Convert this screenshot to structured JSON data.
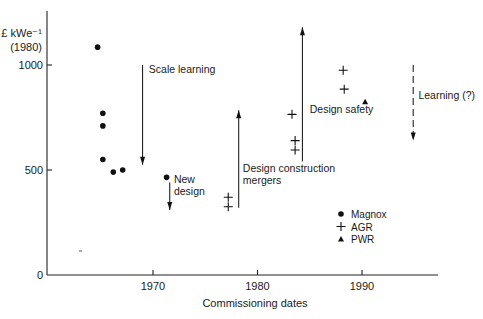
{
  "chart_data": {
    "type": "scatter",
    "title": "",
    "xlabel": "Commissioning dates",
    "ylabel": "£ kWe⁻¹",
    "ylabel_sub": "(1980)",
    "xlim": [
      1961.5,
      1997
    ],
    "ylim": [
      0,
      1150
    ],
    "x_ticks": [
      1970,
      1980,
      1990
    ],
    "x_tick_labels": [
      "1970",
      "1980",
      "1990"
    ],
    "y_ticks": [
      0,
      500,
      1000
    ],
    "y_tick_labels": [
      "0",
      "500",
      "1000"
    ],
    "grid": false,
    "legend_position": "lower right",
    "series": [
      {
        "name": "Magnox",
        "marker": "circle",
        "points": [
          {
            "x": 1964.7,
            "y": 1085
          },
          {
            "x": 1965.2,
            "y": 770
          },
          {
            "x": 1965.2,
            "y": 710
          },
          {
            "x": 1965.2,
            "y": 550
          },
          {
            "x": 1966.2,
            "y": 490
          },
          {
            "x": 1967.1,
            "y": 500
          },
          {
            "x": 1971.3,
            "y": 465
          }
        ]
      },
      {
        "name": "AGR",
        "marker": "plus",
        "points": [
          {
            "x": 1977.2,
            "y": 370
          },
          {
            "x": 1977.2,
            "y": 325
          },
          {
            "x": 1983.3,
            "y": 765
          },
          {
            "x": 1983.6,
            "y": 640
          },
          {
            "x": 1983.6,
            "y": 595
          },
          {
            "x": 1988.2,
            "y": 975
          },
          {
            "x": 1988.3,
            "y": 885
          }
        ]
      },
      {
        "name": "PWR",
        "marker": "triangle",
        "points": [
          {
            "x": 1990.3,
            "y": 825
          }
        ]
      }
    ],
    "annotations": [
      {
        "text": [
          "Scale learning"
        ],
        "arrow": {
          "x": 1969.0,
          "y_from": 1000,
          "y_to": 525,
          "direction": "down",
          "style": "solid"
        },
        "label_x": 1969.6,
        "label_y": 960
      },
      {
        "text": [
          "New",
          "design"
        ],
        "arrow": {
          "x": 1971.6,
          "y_from": 440,
          "y_to": 310,
          "direction": "down",
          "style": "solid"
        },
        "label_x": 1972.0,
        "label_y": 440
      },
      {
        "text": [
          "Design construction",
          "mergers"
        ],
        "arrow": {
          "x": 1978.2,
          "y_from": 320,
          "y_to": 785,
          "direction": "up",
          "style": "solid"
        },
        "label_x": 1978.6,
        "label_y": 490
      },
      {
        "text": [
          "Design safety"
        ],
        "arrow": {
          "x": 1984.3,
          "y_from": 540,
          "y_to": 1180,
          "direction": "up",
          "style": "solid"
        },
        "label_x": 1985.0,
        "label_y": 770
      },
      {
        "text": [
          "Learning (?)"
        ],
        "arrow": {
          "x": 1994.9,
          "y_from": 1000,
          "y_to": 640,
          "direction": "down",
          "style": "dashed"
        },
        "label_x": 1995.4,
        "label_y": 840
      }
    ]
  }
}
